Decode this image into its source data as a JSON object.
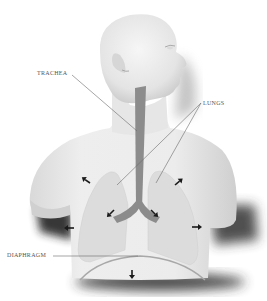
{
  "diagram": {
    "labels": {
      "trachea": "TRACHEA",
      "lungs": "LUNGS",
      "diaphragm": "DIAPHRAGM"
    },
    "arrows": [
      {
        "name": "upper-left-chest",
        "direction": "up-left"
      },
      {
        "name": "upper-right-chest",
        "direction": "up-right"
      },
      {
        "name": "left-bronchus",
        "direction": "down-left"
      },
      {
        "name": "right-bronchus",
        "direction": "down-right"
      },
      {
        "name": "left-side",
        "direction": "left"
      },
      {
        "name": "right-side",
        "direction": "right"
      },
      {
        "name": "diaphragm",
        "direction": "down"
      }
    ],
    "colors": {
      "background": "#ffffff",
      "body": "#ececec",
      "shadow": "#3a3a3a",
      "lungs": "#dcdcdc",
      "trachea": "#8c8c8c",
      "arrows": "#1a1a1a",
      "leader_lines": "#6a6a6a",
      "text": "#555555"
    }
  }
}
